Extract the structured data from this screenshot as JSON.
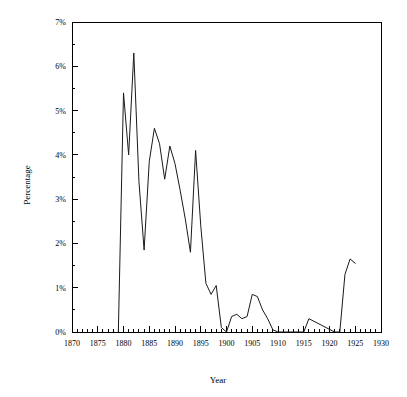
{
  "chart_data": {
    "type": "line",
    "title": "",
    "xlabel": "Year",
    "ylabel": "Percentage",
    "xlim": [
      1870,
      1930
    ],
    "ylim": [
      0,
      7
    ],
    "grid": false,
    "legend": null,
    "x_major_ticks": [
      1870,
      1875,
      1880,
      1885,
      1890,
      1895,
      1900,
      1905,
      1910,
      1915,
      1920,
      1925,
      1930
    ],
    "x_major_tick_labels": [
      "1870",
      "1875",
      "1880",
      "1885",
      "1890",
      "1895",
      "1900",
      "1905",
      "1910",
      "1915",
      "1920",
      "1925",
      "1930"
    ],
    "x_minor_tick_step": 1,
    "y_major_ticks": [
      0,
      1,
      2,
      3,
      4,
      5,
      6,
      7
    ],
    "y_major_tick_labels": [
      "0%",
      "1%",
      "2%",
      "3%",
      "4%",
      "5%",
      "6%",
      "7%"
    ],
    "y_minor_tick_step": 0.5,
    "series": [
      {
        "name": "percentage",
        "color": "#1a1a1a",
        "x": [
          1879,
          1880,
          1881,
          1882,
          1883,
          1884,
          1885,
          1886,
          1887,
          1888,
          1889,
          1890,
          1891,
          1892,
          1893,
          1894,
          1895,
          1896,
          1897,
          1898,
          1899,
          1900,
          1901,
          1902,
          1903,
          1904,
          1905,
          1906,
          1907,
          1908,
          1909,
          1910,
          1915,
          1916,
          1921,
          1922,
          1923,
          1924,
          1925
        ],
        "values": [
          0.0,
          5.4,
          4.0,
          6.3,
          3.4,
          1.85,
          3.85,
          4.6,
          4.25,
          3.45,
          4.2,
          3.8,
          3.2,
          2.55,
          1.8,
          4.1,
          2.4,
          1.1,
          0.85,
          1.05,
          0.1,
          0.0,
          0.35,
          0.4,
          0.3,
          0.35,
          0.85,
          0.8,
          0.5,
          0.3,
          0.05,
          0.0,
          0.0,
          0.3,
          0.0,
          0.0,
          1.3,
          1.65,
          1.55
        ]
      }
    ],
    "annotations": []
  },
  "figure": {
    "background_color": "#ffffff",
    "axis_color": "#000000",
    "line_color": "#1a1a1a"
  }
}
